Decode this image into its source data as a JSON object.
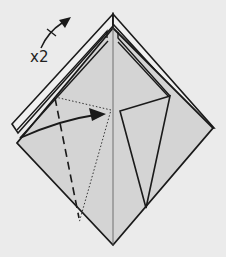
{
  "diagram": {
    "type": "origami-step",
    "repeat_label": "x2",
    "colors": {
      "background": "#ebebeb",
      "paper": "#d4d4d4",
      "paper_edge_light": "#f2f2f2",
      "line": "#1a1a1a"
    },
    "symbols": [
      {
        "name": "repeat-arrow",
        "meaning": "repeat step",
        "label": "x2"
      },
      {
        "name": "valley-fold-line",
        "style": "dashed"
      },
      {
        "name": "existing-crease",
        "style": "dotted"
      },
      {
        "name": "fold-arrow",
        "style": "curved arrow pointing right"
      }
    ]
  }
}
